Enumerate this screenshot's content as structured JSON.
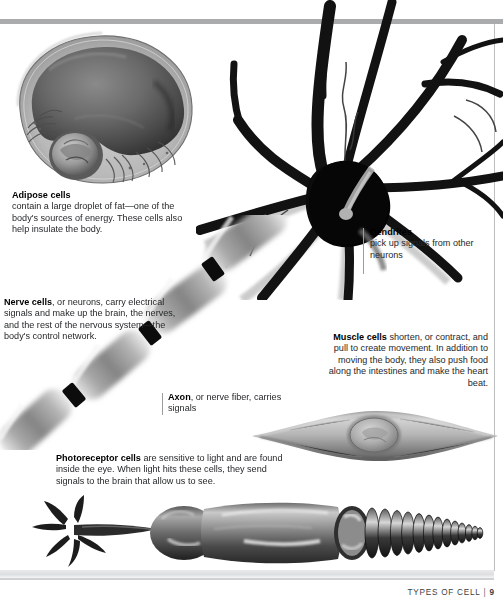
{
  "page": {
    "footer_title": "TYPES OF CELL",
    "footer_separator": "|",
    "footer_page_number": "9",
    "accent_rule_color": "#a9abad",
    "text_color": "#26282a"
  },
  "captions": {
    "adipose": {
      "heading": "Adipose cells",
      "body": " contain a large droplet of fat—one of the body's sources of energy. These cells also help insulate the body.",
      "align": "left"
    },
    "nerve": {
      "heading": "Nerve cells",
      "body": ", or neurons, carry electrical signals and make up the brain, the nerves, and the rest of the nervous system—the body's control network.",
      "align": "left"
    },
    "axon": {
      "heading": "Axon",
      "body": ", or nerve fiber, carries signals",
      "align": "left"
    },
    "dendrites": {
      "heading": "Dendrites",
      "body": "pick up signals from other neurons",
      "align": "left"
    },
    "muscle": {
      "heading": "Muscle cells",
      "body": " shorten, or contract, and pull to create movement. In addition to moving the body, they also push food along the intestines and make the heart beat.",
      "align": "right"
    },
    "photoreceptor": {
      "heading": "Photoreceptor cells",
      "body": " are sensitive to light and are found inside the eye. When light hits these cells, they send signals to the brain that allow us to see.",
      "align": "left"
    }
  },
  "illustrations": {
    "adipose_cell": "adipose-cell-illustration",
    "neuron_soma": "neuron-cell-body-illustration",
    "axon": "myelinated-axon-illustration",
    "muscle_cell": "muscle-cell-illustration",
    "photoreceptor_cell": "photoreceptor-rod-cell-illustration"
  }
}
